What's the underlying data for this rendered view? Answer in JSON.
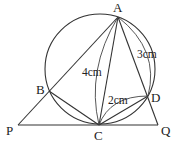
{
  "diagram": {
    "points": {
      "A": {
        "label": "A",
        "x": 118,
        "y": 17
      },
      "B": {
        "label": "B",
        "x": 49,
        "y": 91
      },
      "C": {
        "label": "C",
        "x": 99,
        "y": 125
      },
      "D": {
        "label": "D",
        "x": 148,
        "y": 96
      },
      "P": {
        "label": "P",
        "x": 18,
        "y": 125
      },
      "Q": {
        "label": "Q",
        "x": 158,
        "y": 125
      }
    },
    "circle": {
      "cx": 100,
      "cy": 69,
      "r": 55
    },
    "measurements": {
      "AC": "4cm",
      "AD": "3cm",
      "CD": "2cm"
    }
  }
}
